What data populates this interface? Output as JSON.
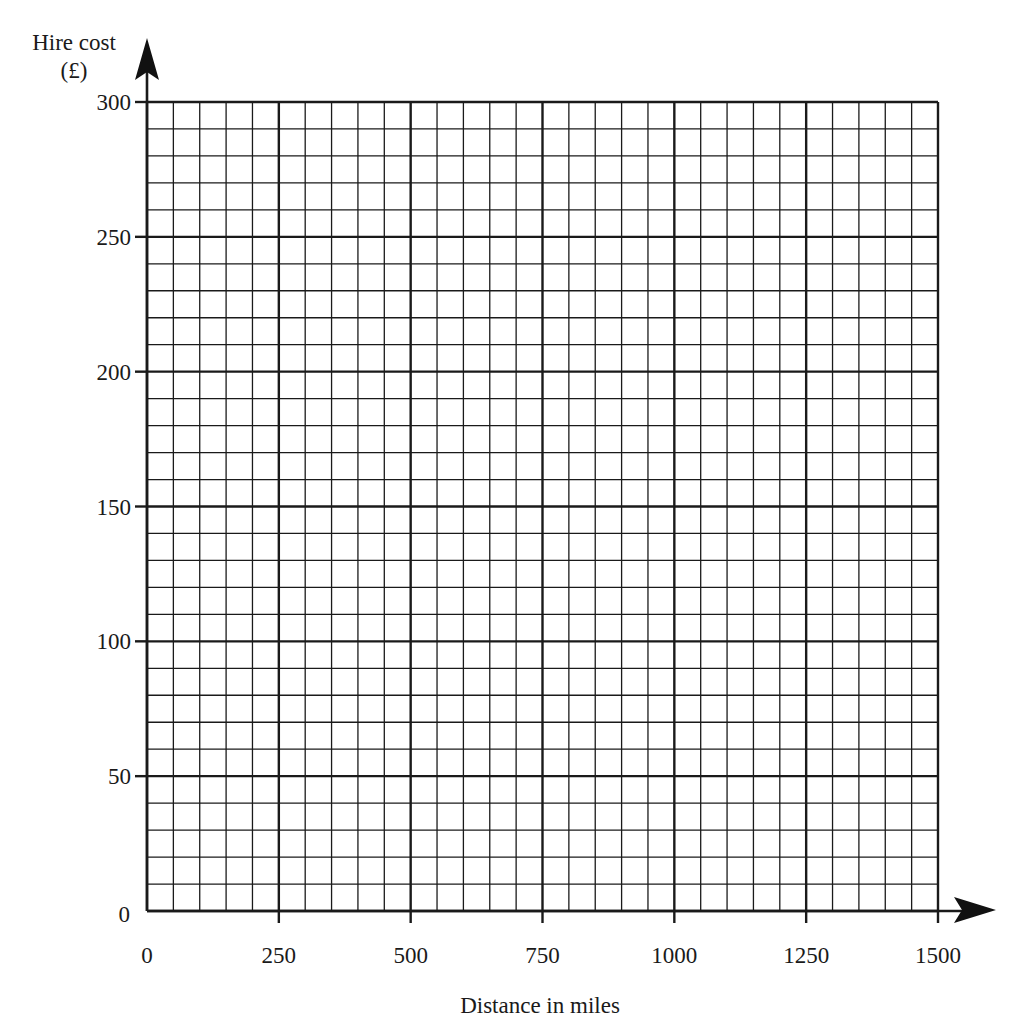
{
  "chart_data": {
    "type": "line",
    "title": "",
    "xlabel": "Distance in miles",
    "ylabel": "Hire cost",
    "ylabel_unit": "(£)",
    "xlim": [
      0,
      1500
    ],
    "ylim": [
      0,
      300
    ],
    "x_ticks": [
      0,
      250,
      500,
      750,
      1000,
      1250,
      1500
    ],
    "y_ticks": [
      0,
      50,
      100,
      150,
      200,
      250,
      300
    ],
    "x_minor_step": 50,
    "y_minor_step": 10,
    "grid": true,
    "series": [],
    "legend": null
  },
  "colors": {
    "grid_line": "#1a1a1a",
    "background": "#ffffff"
  }
}
